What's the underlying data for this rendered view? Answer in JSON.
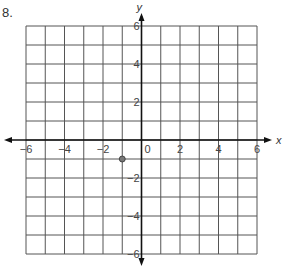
{
  "problem": {
    "number_label": "8."
  },
  "chart_data": {
    "type": "scatter",
    "title": "",
    "xlabel": "x",
    "ylabel": "y",
    "xlim": [
      -6,
      6
    ],
    "ylim": [
      -6,
      6
    ],
    "grid": true,
    "x_ticks": [
      -6,
      -4,
      -2,
      0,
      2,
      4,
      6
    ],
    "y_ticks": [
      -6,
      -4,
      -2,
      2,
      4,
      6
    ],
    "x_tick_labels": [
      "−6",
      "−4",
      "−2",
      "0",
      "2",
      "4",
      "6"
    ],
    "y_tick_labels": [
      "−6",
      "−4",
      "−2",
      "2",
      "4",
      "6"
    ],
    "points": [
      {
        "x": -1,
        "y": -1
      }
    ],
    "colors": {
      "grid": "#555555",
      "axis": "#111111",
      "point": "#777777"
    }
  }
}
